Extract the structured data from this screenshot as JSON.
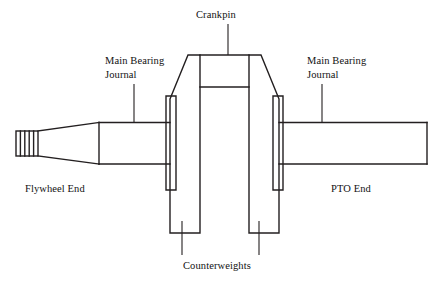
{
  "diagram": {
    "type": "engineering-line-drawing",
    "background_color": "#ffffff",
    "line_color": "#231f20",
    "labels": {
      "crankpin": "Crankpin",
      "main_bearing_journal_left_line1": "Main Bearing",
      "main_bearing_journal_left_line2": "Journal",
      "main_bearing_journal_right_line1": "Main Bearing",
      "main_bearing_journal_right_line2": "Journal",
      "flywheel_end": "Flywheel End",
      "pto_end": "PTO End",
      "counterweights": "Counterweights"
    },
    "parts": {
      "spline_segments": 5,
      "counterweight_count": 2,
      "journal_count": 2
    }
  }
}
